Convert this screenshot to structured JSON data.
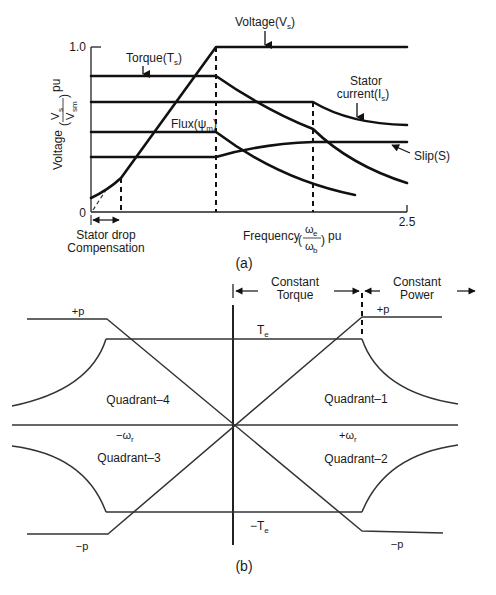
{
  "figure_a": {
    "caption": "(a)",
    "y_axis": {
      "label_prefix": "Voltage",
      "frac_num": "V",
      "frac_num_sub": "s",
      "frac_den": "V",
      "frac_den_sub": "sm",
      "unit": "pu",
      "tick_top": "1.0",
      "tick_zero": "0"
    },
    "x_axis": {
      "label_prefix": "Frequency",
      "frac_num": "ω",
      "frac_num_sub": "e",
      "frac_den": "ω",
      "frac_den_sub": "b",
      "unit": "pu",
      "tick_end": "2.5"
    },
    "annotations": {
      "voltage": "Voltage(V",
      "voltage_sub": "s",
      "torque": "Torque(T",
      "torque_sub": "s",
      "flux": "Flux(ψ",
      "flux_sub": "m",
      "stator_current_1": "Stator",
      "stator_current_2": "current(I",
      "stator_current_sub": "s",
      "slip": "Slip(S)",
      "stator_drop_1": "Stator drop",
      "stator_drop_2": "Compensation"
    }
  },
  "figure_b": {
    "caption": "(b)",
    "regions": {
      "constant_torque_1": "Constant",
      "constant_torque_2": "Torque",
      "constant_power_1": "Constant",
      "constant_power_2": "Power"
    },
    "labels": {
      "te_pos": "T",
      "te_pos_sub": "e",
      "te_neg": "−T",
      "te_neg_sub": "e",
      "p_pos_left": "+p",
      "p_pos_right": "+p",
      "p_neg_left": "−p",
      "p_neg_right": "−p",
      "wr_neg": "−ω",
      "wr_neg_sub": "r",
      "wr_pos": "+ω",
      "wr_pos_sub": "r"
    },
    "quadrants": {
      "q1": "Quadrant–1",
      "q2": "Quadrant–2",
      "q3": "Quadrant–3",
      "q4": "Quadrant–4"
    }
  }
}
